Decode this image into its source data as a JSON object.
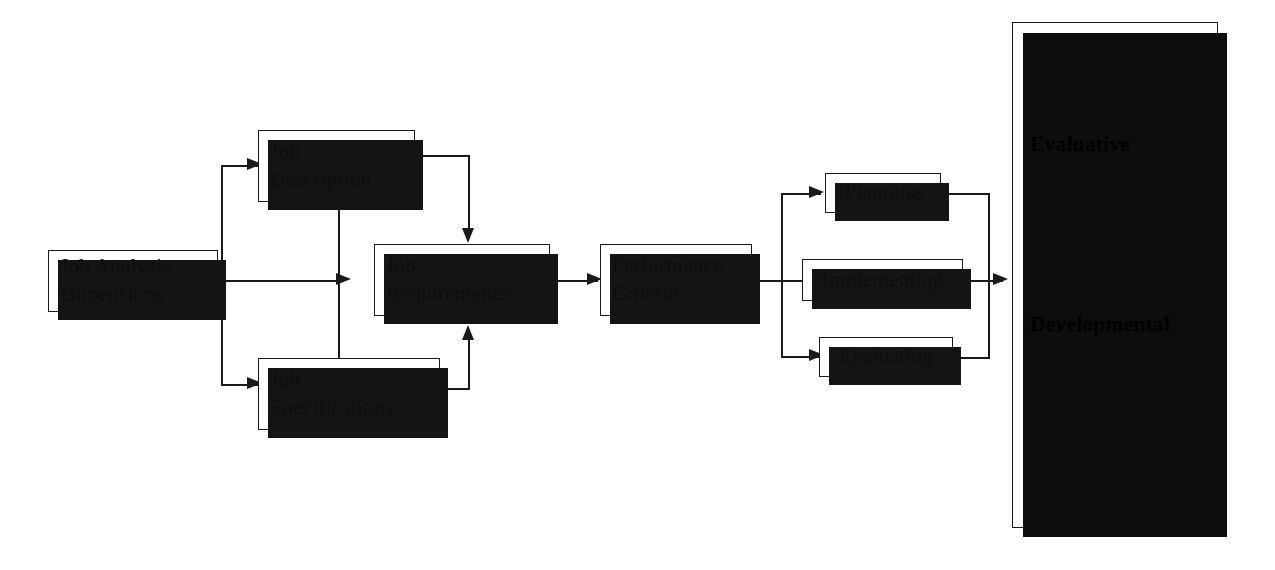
{
  "diagram": {
    "nodes": {
      "job_analysis_dimensions": "Job Analysis\nDimensions",
      "job_description": "Job\nDescription",
      "job_specifications": "Job\nSpecifications",
      "job_requirements": "Job\nRequirements",
      "performance_criteria": "Performance\nCriteria",
      "planning": "Planning",
      "implementing": "Implementing",
      "evaluating": "Evaluating"
    },
    "panel": {
      "title": "Purpose of\nPerformance\nEvaluation",
      "sections": [
        {
          "heading": "Evaluative",
          "items": [
            "Compensation",
            "Legal",
            "Penalties",
            "Personnel",
            "Promotion"
          ]
        },
        {
          "heading": "Developmental",
          "items": [
            "Development",
            "Feedback",
            "Goals",
            "Motivation",
            "Planning",
            "Training"
          ]
        }
      ],
      "bullet": "•"
    },
    "colors": {
      "line": "#1a1a1a",
      "shadow": "#141414",
      "background": "#ffffff",
      "text": "#0d0d0d"
    }
  }
}
